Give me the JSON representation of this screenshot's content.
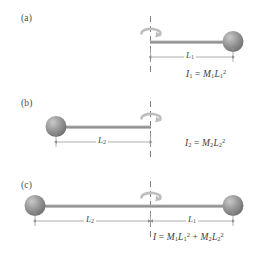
{
  "figure": {
    "background_color": "#ffffff",
    "sphere_color": "#8c8c8c",
    "sphere_highlight": "#c9c9c9",
    "rod_color": "#9a9a9a",
    "axis_color": "#7e7e7e",
    "arrow_color": "#b9b9b9",
    "text_color": "#3d3d3d"
  },
  "panels": [
    {
      "id": "a",
      "label": "(a)",
      "description": "Single mass M1 at distance L1 to the right of the rotation axis",
      "dimension": {
        "symbol": "L",
        "subscript": "1"
      },
      "formula": {
        "lhs_symbol": "I",
        "lhs_subscript": "1",
        "equals": "=",
        "terms": [
          {
            "mass_symbol": "M",
            "mass_subscript": "1",
            "length_symbol": "L",
            "length_subscript": "1",
            "exponent": "2"
          }
        ]
      }
    },
    {
      "id": "b",
      "label": "(b)",
      "description": "Single mass M2 at distance L2 to the left of the rotation axis",
      "dimension": {
        "symbol": "L",
        "subscript": "2"
      },
      "formula": {
        "lhs_symbol": "I",
        "lhs_subscript": "2",
        "equals": "=",
        "terms": [
          {
            "mass_symbol": "M",
            "mass_subscript": "2",
            "length_symbol": "L",
            "length_subscript": "2",
            "exponent": "2"
          }
        ]
      }
    },
    {
      "id": "c",
      "label": "(c)",
      "description": "Mass M2 at distance L2 left and mass M1 at distance L1 right of the rotation axis",
      "dimension_left": {
        "symbol": "L",
        "subscript": "2"
      },
      "dimension_right": {
        "symbol": "L",
        "subscript": "1"
      },
      "formula": {
        "lhs_symbol": "I",
        "lhs_subscript": "",
        "equals": "=",
        "plus": "+",
        "terms": [
          {
            "mass_symbol": "M",
            "mass_subscript": "1",
            "length_symbol": "L",
            "length_subscript": "1",
            "exponent": "2"
          },
          {
            "mass_symbol": "M",
            "mass_subscript": "2",
            "length_symbol": "L",
            "length_subscript": "2",
            "exponent": "2"
          }
        ]
      }
    }
  ]
}
